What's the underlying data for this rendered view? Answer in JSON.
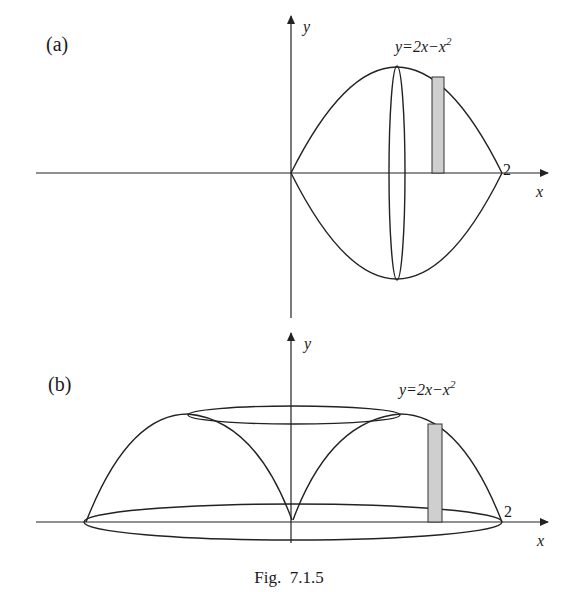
{
  "figure": {
    "caption": "Fig.  7.1.5",
    "panel_a": {
      "label": "(a)",
      "curve_label_prefix": "y=2x−x",
      "curve_label_exp": "2",
      "x_axis_label": "x",
      "y_axis_label": "y",
      "x_tick_label": "2",
      "description": "Region under y=2x-x^2 from x=0 to 2 reflected about x-axis (solid of revolution about x-axis), with shaded vertical strip and elliptical cross-section at x=1"
    },
    "panel_b": {
      "label": "(b)",
      "curve_label_prefix": "y=2x−x",
      "curve_label_exp": "2",
      "x_axis_label": "x",
      "y_axis_label": "y",
      "x_tick_label": "2",
      "description": "Region under y=2x-x^2 rotated about the y-axis (shell method), with shaded vertical strip, top ellipse at y=1 and base ellipse of radius 2"
    }
  }
}
